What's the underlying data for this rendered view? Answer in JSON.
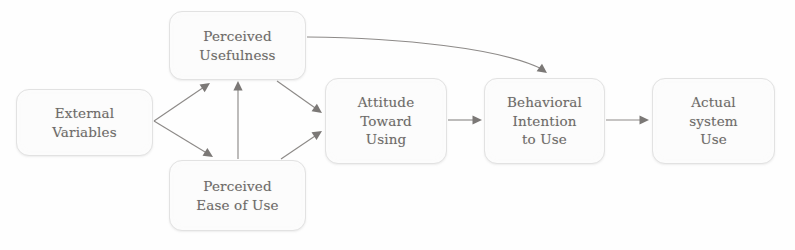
{
  "diagram": {
    "type": "flow-diagram",
    "background_color": "#fefefe",
    "node_fill": "#fcfcfc",
    "node_border": "#e2e2e2",
    "text_color": "#6d6a68",
    "edge_color": "#8d8a88",
    "nodes": [
      {
        "id": "external-variables",
        "lines": [
          "External",
          "Variables"
        ],
        "x": 16,
        "y": 89,
        "w": 137,
        "h": 67
      },
      {
        "id": "perceived-usefulness",
        "lines": [
          "Perceived",
          "Usefulness"
        ],
        "x": 169,
        "y": 11,
        "w": 137,
        "h": 69
      },
      {
        "id": "perceived-ease-of-use",
        "lines": [
          "Perceived",
          "Ease of Use"
        ],
        "x": 169,
        "y": 160,
        "w": 137,
        "h": 71
      },
      {
        "id": "attitude-toward-using",
        "lines": [
          "Attitude",
          "Toward",
          "Using"
        ],
        "x": 325,
        "y": 78,
        "w": 122,
        "h": 86
      },
      {
        "id": "behavioral-intention-to-use",
        "lines": [
          "Behavioral",
          "Intention",
          "to Use"
        ],
        "x": 484,
        "y": 78,
        "w": 121,
        "h": 86
      },
      {
        "id": "actual-system-use",
        "lines": [
          "Actual",
          "system",
          "Use"
        ],
        "x": 652,
        "y": 78,
        "w": 123,
        "h": 86
      }
    ],
    "edges": [
      {
        "id": "ev-to-pu",
        "from": "external-variables",
        "to": "perceived-usefulness",
        "path": "M 154 121 L 207 85",
        "arrow_at": [
          210,
          83
        ],
        "arrow_rot": -34
      },
      {
        "id": "ev-to-peou",
        "from": "external-variables",
        "to": "perceived-ease-of-use",
        "path": "M 154 121 L 210 155",
        "arrow_at": [
          213,
          157
        ],
        "arrow_rot": 32
      },
      {
        "id": "peou-to-pu",
        "from": "perceived-ease-of-use",
        "to": "perceived-usefulness",
        "path": "M 238 159 L 238 85",
        "arrow_at": [
          238,
          81
        ],
        "arrow_rot": -90
      },
      {
        "id": "pu-to-att",
        "from": "perceived-usefulness",
        "to": "attitude-toward-using",
        "path": "M 277 81 L 318 110",
        "arrow_at": [
          322,
          113
        ],
        "arrow_rot": 35
      },
      {
        "id": "peou-to-att",
        "from": "perceived-ease-of-use",
        "to": "attitude-toward-using",
        "path": "M 281 159 L 318 134",
        "arrow_at": [
          322,
          131
        ],
        "arrow_rot": -33
      },
      {
        "id": "att-to-bi",
        "from": "attitude-toward-using",
        "to": "behavioral-intention-to-use",
        "path": "M 448 120 L 477 120",
        "arrow_at": [
          482,
          120
        ],
        "arrow_rot": 0
      },
      {
        "id": "bi-to-asu",
        "from": "behavioral-intention-to-use",
        "to": "actual-system-use",
        "path": "M 606 120 L 644 120",
        "arrow_at": [
          649,
          120
        ],
        "arrow_rot": 0
      },
      {
        "id": "pu-to-bi",
        "from": "perceived-usefulness",
        "to": "behavioral-intention-to-use",
        "path": "M 307 37 C 400 38, 500 48, 542 69",
        "arrow_at": [
          547,
          73
        ],
        "arrow_rot": 36
      }
    ]
  }
}
